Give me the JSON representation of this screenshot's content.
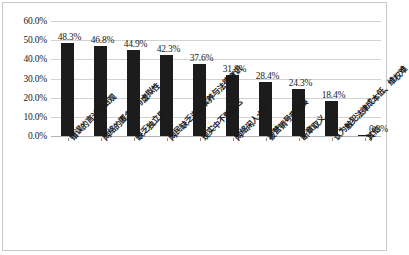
{
  "chart_data": {
    "type": "bar",
    "title": "",
    "subtitle": "",
    "xlabel": "",
    "ylabel": "",
    "ylim": [
      0,
      60
    ],
    "grid": true,
    "legend": false,
    "orientation": "vertical",
    "bar_color": "#1c1c1c",
    "axis": {
      "y_ticks": [
        0,
        10,
        20,
        30,
        40,
        50,
        60
      ],
      "y_tick_labels": [
        "0.0%",
        "10.0%",
        "20.0%",
        "30.0%",
        "40.0%",
        "50.0%",
        "60.0%"
      ],
      "y_unit": "%"
    },
    "categories": [
      "错误的言论自由观",
      "网络的匿名性与虚拟性",
      "缺乏独立思考",
      "网民缺乏道德素养与法律意识",
      "现实中不敢表达",
      "网络闲人太多",
      "被营销号带节奏",
      "断章取义",
      "认为触犯法律成本低、维权难",
      "其他"
    ],
    "values": [
      48.3,
      46.8,
      44.9,
      42.3,
      37.6,
      31.8,
      28.4,
      24.3,
      18.4,
      0.3
    ],
    "value_labels": [
      "48.3%",
      "46.8%",
      "44.9%",
      "42.3%",
      "37.6%",
      "31.8%",
      "28.4%",
      "24.3%",
      "18.4%",
      "0.3%"
    ]
  }
}
